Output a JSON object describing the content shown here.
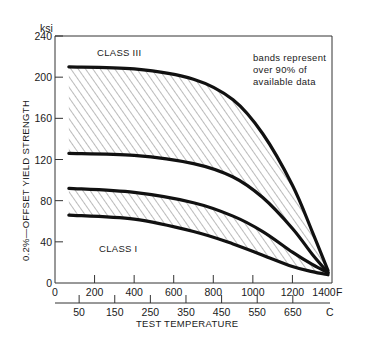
{
  "chart_data": {
    "type": "area",
    "title": "",
    "xlabel": "TEST TEMPERATURE",
    "ylabel": "0.2%-OFFSET YIELD STRENGTH",
    "y_unit": "ksi",
    "x_unit_primary": "F",
    "x_unit_secondary": "C",
    "ylim": [
      0,
      240
    ],
    "xlim": [
      0,
      1400
    ],
    "y_ticks": [
      0,
      40,
      80,
      120,
      160,
      200,
      240
    ],
    "x_ticks_F": [
      0,
      200,
      400,
      600,
      800,
      1000,
      1200,
      1400
    ],
    "x_ticks_C": [
      50,
      150,
      250,
      350,
      450,
      550,
      650
    ],
    "grid": false,
    "annotation": [
      "bands represent",
      "over 90% of",
      "available data"
    ],
    "series": [
      {
        "name": "CLASS III",
        "type": "band",
        "upper": {
          "x": [
            70,
            400,
            700,
            900,
            1050,
            1200,
            1300,
            1380
          ],
          "y": [
            210,
            208,
            198,
            178,
            145,
            95,
            50,
            12
          ]
        },
        "lower": {
          "x": [
            70,
            400,
            700,
            900,
            1050,
            1200,
            1300,
            1380
          ],
          "y": [
            126,
            124,
            116,
            103,
            83,
            53,
            28,
            10
          ]
        }
      },
      {
        "name": "CLASS I",
        "type": "band",
        "upper": {
          "x": [
            70,
            400,
            700,
            900,
            1050,
            1200,
            1300,
            1380
          ],
          "y": [
            92,
            88,
            78,
            65,
            50,
            30,
            18,
            10
          ]
        },
        "lower": {
          "x": [
            70,
            400,
            700,
            900,
            1050,
            1200,
            1300,
            1380
          ],
          "y": [
            66,
            62,
            50,
            38,
            27,
            16,
            11,
            8
          ]
        }
      }
    ]
  },
  "labels": {
    "y_unit": "ksi",
    "y_axis_title": "0.2%—OFFSET YIELD STRENGTH",
    "x_axis_title": "TEST TEMPERATURE",
    "x_unit_F": "F",
    "x_unit_C": "C",
    "class_iii": "CLASS III",
    "class_i": "CLASS I",
    "note_line1": "bands represent",
    "note_line2": "over 90% of",
    "note_line3": "available data"
  }
}
